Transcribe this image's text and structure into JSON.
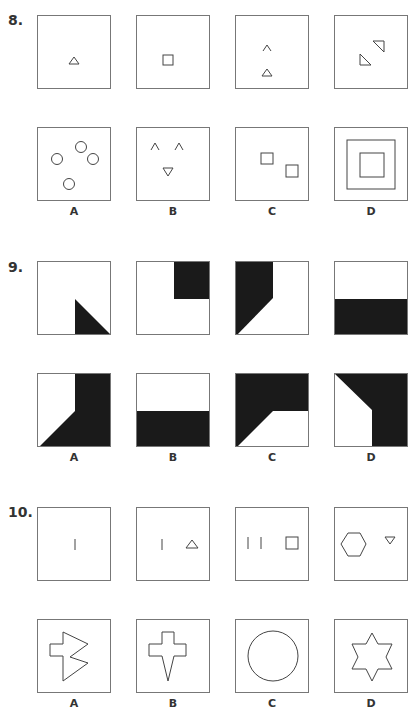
{
  "questions": [
    {
      "number": "8.",
      "prompt_figures": [
        {
          "description": "small triangle"
        },
        {
          "description": "small square"
        },
        {
          "description": "caret above triangle"
        },
        {
          "description": "two right triangles diagonal"
        }
      ],
      "options": [
        {
          "label": "A",
          "description": "four circles"
        },
        {
          "label": "B",
          "description": "two carets and inverted triangle"
        },
        {
          "label": "C",
          "description": "two offset squares"
        },
        {
          "label": "D",
          "description": "nested squares"
        }
      ]
    },
    {
      "number": "9.",
      "prompt_figures": [
        {
          "description": "black triangle bottom-right"
        },
        {
          "description": "black square top-right"
        },
        {
          "description": "black shape left side"
        },
        {
          "description": "black bottom half"
        }
      ],
      "options": [
        {
          "label": "A",
          "description": "black right region with diagonal"
        },
        {
          "label": "B",
          "description": "black bottom half"
        },
        {
          "label": "C",
          "description": "black top region with diagonal"
        },
        {
          "label": "D",
          "description": "black top-right region with diagonal"
        }
      ]
    },
    {
      "number": "10.",
      "prompt_figures": [
        {
          "description": "one line"
        },
        {
          "description": "one line and triangle"
        },
        {
          "description": "two lines and square"
        },
        {
          "description": "hexagon and inverted triangle"
        }
      ],
      "options": [
        {
          "label": "A",
          "description": "irregular arrow polygon"
        },
        {
          "label": "B",
          "description": "cross with spike"
        },
        {
          "label": "C",
          "description": "circle"
        },
        {
          "label": "D",
          "description": "six-pointed star"
        }
      ]
    }
  ]
}
